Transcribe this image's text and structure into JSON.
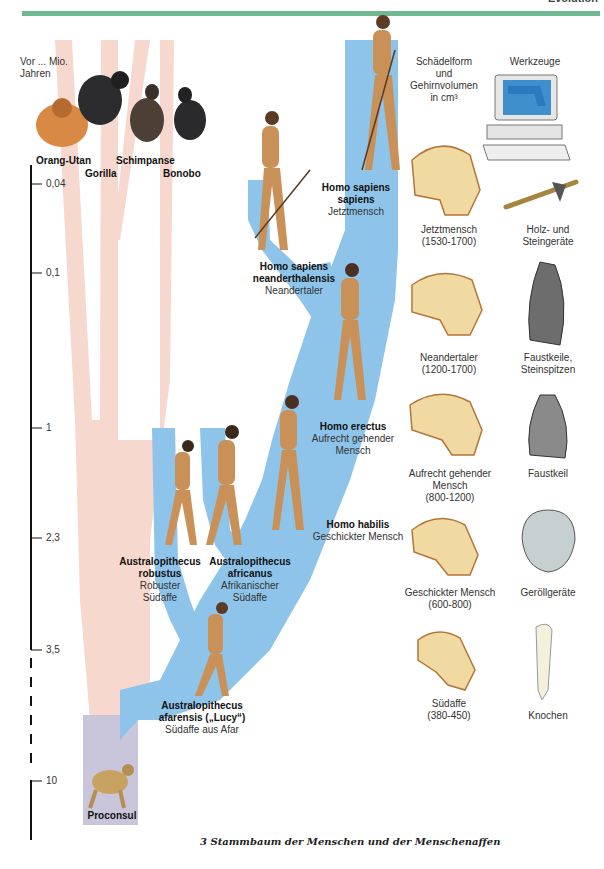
{
  "header": {
    "section_label": "Evolution",
    "accent_color": "#6fb890"
  },
  "axis": {
    "title_line1": "Vor ... Mio.",
    "title_line2": "Jahren",
    "ticks": [
      {
        "label": "0,04",
        "y": 184
      },
      {
        "label": "0,1",
        "y": 273
      },
      {
        "label": "1",
        "y": 428
      },
      {
        "label": "2,3",
        "y": 538
      },
      {
        "label": "3,5",
        "y": 650
      },
      {
        "label": "10",
        "y": 781
      }
    ]
  },
  "apes": [
    {
      "name": "Orang-Utan"
    },
    {
      "name": "Gorilla"
    },
    {
      "name": "Schimpanse"
    },
    {
      "name": "Bonobo"
    }
  ],
  "hominids": [
    {
      "latin_line1": "Homo sapiens",
      "latin_line2": "sapiens",
      "common": "Jetztmensch"
    },
    {
      "latin_line1": "Homo sapiens",
      "latin_line2": "neanderthalensis",
      "common": "Neandertaler"
    },
    {
      "latin_line1": "Homo erectus",
      "common_line1": "Aufrecht gehender",
      "common_line2": "Mensch"
    },
    {
      "latin_line1": "Homo habilis",
      "common": "Geschickter Mensch"
    },
    {
      "latin_line1": "Australopithecus",
      "latin_line2": "robustus",
      "common_line1": "Robuster",
      "common_line2": "Südaffe"
    },
    {
      "latin_line1": "Australopithecus",
      "latin_line2": "africanus",
      "common_line1": "Afrikanischer",
      "common_line2": "Südaffe"
    },
    {
      "latin_line1": "Australopithecus",
      "latin_line2": "afarensis („Lucy“)",
      "common": "Südaffe aus Afar"
    },
    {
      "latin_line1": "Proconsul"
    }
  ],
  "columns": {
    "skull_header_line1": "Schädelform",
    "skull_header_line2": "und",
    "skull_header_line3": "Gehirnvolumen",
    "skull_header_line4": "in cm³",
    "tools_header": "Werkzeuge"
  },
  "skulls": [
    {
      "line1": "Jetztmensch",
      "line2": "(1530-1700)"
    },
    {
      "line1": "Neandertaler",
      "line2": "(1200-1700)"
    },
    {
      "line1": "Aufrecht gehender",
      "line2": "Mensch",
      "line3": "(800-1200)"
    },
    {
      "line1": "Geschickter Mensch",
      "line2": "(600-800)"
    },
    {
      "line1": "Südaffe",
      "line2": "(380-450)"
    }
  ],
  "tools": [
    {
      "line1": "Holz- und",
      "line2": "Steingeräte"
    },
    {
      "line1": "Faustkeile,",
      "line2": "Steinspitzen"
    },
    {
      "line1": "Faustkeil"
    },
    {
      "line1": "Geröllgeräte"
    },
    {
      "line1": "Knochen"
    }
  ],
  "caption": "3  Stammbaum der Menschen und der Menschenaffen",
  "colors": {
    "ape_branch": "#f6d6cc",
    "human_branch": "#8ec3ea",
    "root": "#c9c5d9",
    "skull": "#f1d9a2",
    "skin": "#c99058"
  }
}
